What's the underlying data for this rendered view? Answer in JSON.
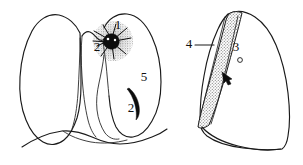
{
  "figure": {
    "background_color": "#ffffff",
    "ink_color": "#1a1a1a",
    "lesion_color": "#0d0d0d",
    "stipple_color": "#8a8a8a"
  },
  "panels": [
    {
      "id": "frontal-view",
      "name": "frontal-chest-view",
      "description": "Frontal (PA) chest outline showing both lungs, mediastinum and diaphragm"
    },
    {
      "id": "lateral-view",
      "name": "lateral-chest-view",
      "description": "Lateral chest outline with stippled wedge-shaped opacity"
    }
  ],
  "labels": [
    {
      "id": "label-1",
      "name": "label-1-upper-lobe",
      "text": "1",
      "panel": "frontal-view",
      "x": 118,
      "y": 26
    },
    {
      "id": "label-2-hilar",
      "name": "label-2-hilar-mass",
      "text": "2",
      "panel": "frontal-view",
      "x": 97,
      "y": 48
    },
    {
      "id": "label-2-lower",
      "name": "label-2-lower-lesion",
      "text": "2",
      "panel": "frontal-view",
      "x": 131,
      "y": 109
    },
    {
      "id": "label-5",
      "name": "label-5-lateral-lung-field",
      "text": "5",
      "panel": "frontal-view",
      "x": 144,
      "y": 78
    },
    {
      "id": "label-3",
      "name": "label-3-fissure",
      "text": "3",
      "panel": "lateral-view",
      "x": 236,
      "y": 48
    },
    {
      "id": "label-4",
      "name": "label-4-wedge-opacity",
      "text": "4",
      "panel": "lateral-view",
      "x": 189,
      "y": 45
    }
  ],
  "markers": [
    {
      "id": "spiculated-mass",
      "name": "spiculated-hilar-mass",
      "shape": "star-burst",
      "panel": "frontal-view"
    },
    {
      "id": "crescent-lesion",
      "name": "solid-crescent-lesion",
      "shape": "crescent",
      "panel": "frontal-view"
    },
    {
      "id": "pointer-arrow",
      "name": "arrow-marker",
      "shape": "arrowhead",
      "panel": "lateral-view"
    },
    {
      "id": "small-nodule",
      "name": "small-circle-marker",
      "shape": "circle",
      "panel": "lateral-view"
    },
    {
      "id": "leader-line-4",
      "name": "leader-line-label-4",
      "shape": "line",
      "panel": "lateral-view"
    }
  ]
}
